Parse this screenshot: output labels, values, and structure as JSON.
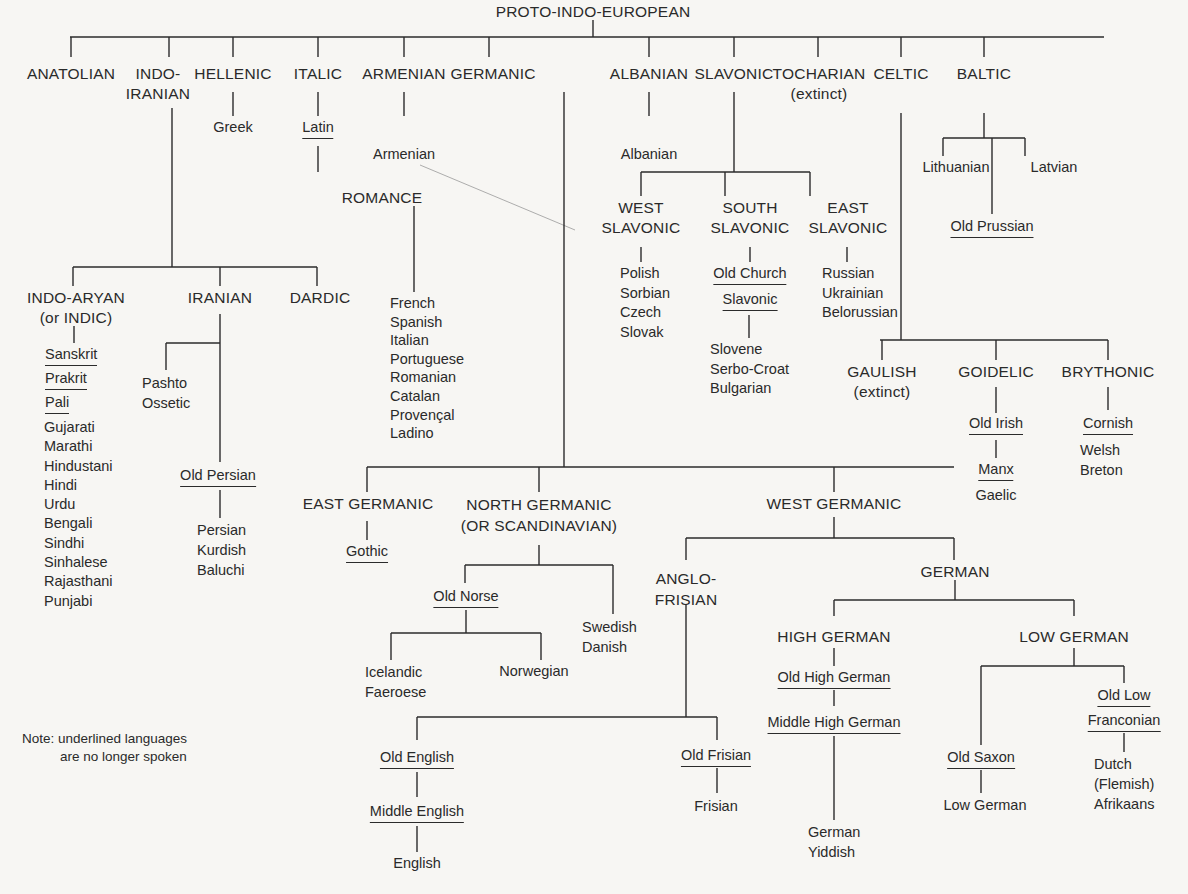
{
  "title": "PROTO-INDO-EUROPEAN",
  "branches": {
    "anatolian": "ANATOLIAN",
    "indo_iranian": [
      "INDO-",
      "IRANIAN"
    ],
    "hellenic": "HELLENIC",
    "italic": "ITALIC",
    "armenian": "ARMENIAN",
    "germanic": "GERMANIC",
    "albanian": "ALBANIAN",
    "slavonic": "SLAVONIC",
    "tocharian": [
      "TOCHARIAN",
      "(extinct)"
    ],
    "celtic": "CELTIC",
    "baltic": "BALTIC"
  },
  "hellenic": {
    "greek": "Greek"
  },
  "italic": {
    "latin": "Latin",
    "romance": "ROMANCE",
    "romance_languages": [
      "French",
      "Spanish",
      "Italian",
      "Portuguese",
      "Romanian",
      "Catalan",
      "Provençal",
      "Ladino"
    ]
  },
  "armenian": {
    "armenian": "Armenian"
  },
  "albanian": {
    "albanian": "Albanian"
  },
  "indo_iranian": {
    "indo_aryan": [
      "INDO-ARYAN",
      "(or INDIC)"
    ],
    "iranian": "IRANIAN",
    "dardic": "DARDIC",
    "indo_aryan_extinct": [
      "Sanskrit",
      "Prakrit",
      "Pali"
    ],
    "indo_aryan_languages": [
      "Gujarati",
      "Marathi",
      "Hindustani",
      "Hindi",
      "Urdu",
      "Bengali",
      "Sindhi",
      "Sinhalese",
      "Rajasthani",
      "Punjabi"
    ],
    "iranian_east": [
      "Pashto",
      "Ossetic"
    ],
    "old_persian": "Old Persian",
    "persian_languages": [
      "Persian",
      "Kurdish",
      "Baluchi"
    ]
  },
  "slavonic": {
    "west": [
      "WEST",
      "SLAVONIC"
    ],
    "south": [
      "SOUTH",
      "SLAVONIC"
    ],
    "east": [
      "EAST",
      "SLAVONIC"
    ],
    "west_languages": [
      "Polish",
      "Sorbian",
      "Czech",
      "Slovak"
    ],
    "old_church": [
      "Old Church",
      "Slavonic"
    ],
    "south_languages": [
      "Slovene",
      "Serbo-Croat",
      "Bulgarian"
    ],
    "east_languages": [
      "Russian",
      "Ukrainian",
      "Belorussian"
    ]
  },
  "baltic": {
    "lithuanian": "Lithuanian",
    "latvian": "Latvian",
    "old_prussian": "Old Prussian"
  },
  "celtic": {
    "gaulish": [
      "GAULISH",
      "(extinct)"
    ],
    "goidelic": "GOIDELIC",
    "brythonic": "BRYTHONIC",
    "old_irish": "Old Irish",
    "manx": "Manx",
    "gaelic": "Gaelic",
    "cornish": "Cornish",
    "brythonic_languages": [
      "Welsh",
      "Breton"
    ]
  },
  "germanic": {
    "east": "EAST GERMANIC",
    "north": [
      "NORTH GERMANIC",
      "(OR SCANDINAVIAN)"
    ],
    "west": "WEST GERMANIC",
    "gothic": "Gothic",
    "old_norse": "Old Norse",
    "norse_west": [
      "Icelandic",
      "Faeroese"
    ],
    "norwegian": "Norwegian",
    "norse_east": [
      "Swedish",
      "Danish"
    ],
    "anglo_frisian": [
      "ANGLO-",
      "FRISIAN"
    ],
    "german": "GERMAN",
    "old_english": "Old English",
    "middle_english": "Middle English",
    "english": "English",
    "old_frisian": "Old Frisian",
    "frisian": "Frisian",
    "high_german": "HIGH GERMAN",
    "low_german": "LOW GERMAN",
    "old_high_german": "Old High German",
    "middle_high_german": "Middle High German",
    "high_german_languages": [
      "German",
      "Yiddish"
    ],
    "old_saxon": "Old Saxon",
    "low_german_lang": "Low German",
    "old_low_franconian": [
      "Old Low",
      "Franconian"
    ],
    "franconian_languages": [
      "Dutch",
      "(Flemish)",
      "Afrikaans"
    ]
  },
  "note": [
    "Note: underlined languages",
    "are no longer spoken"
  ]
}
